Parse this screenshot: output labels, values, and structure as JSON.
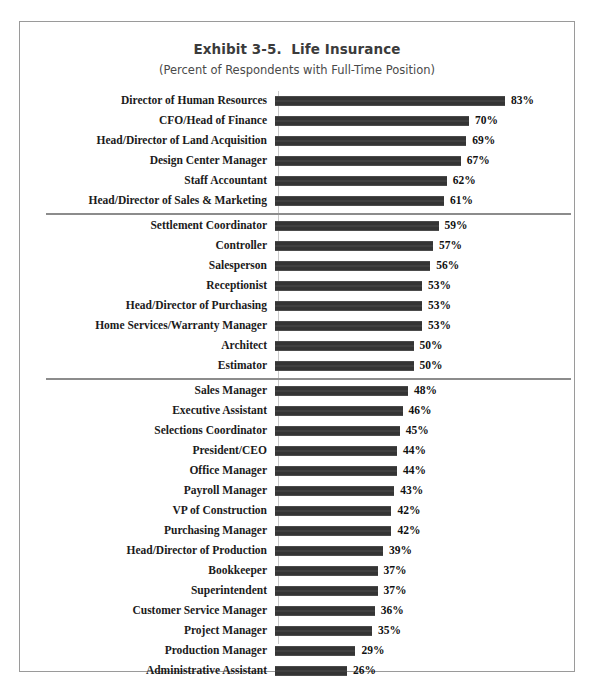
{
  "chart_data": {
    "type": "bar",
    "orientation": "horizontal",
    "title": "Exhibit 3-5.  Life Insurance",
    "subtitle": "(Percent of Respondents with Full-Time Position)",
    "xlabel": "",
    "ylabel": "",
    "xlim": [
      0,
      83
    ],
    "grid": false,
    "legend": null,
    "value_suffix": "%",
    "bar_color": "#3c3c3c",
    "separator_color": "#8c8c8c",
    "border_color": "#9a9a9a",
    "categories": [
      "Director of Human Resources",
      "CFO/Head of Finance",
      "Head/Director of Land Acquisition",
      "Design Center Manager",
      "Staff Accountant",
      "Head/Director of Sales & Marketing",
      "Settlement Coordinator",
      "Controller",
      "Salesperson",
      "Receptionist",
      "Head/Director of Purchasing",
      "Home Services/Warranty Manager",
      "Architect",
      "Estimator",
      "Sales Manager",
      "Executive Assistant",
      "Selections Coordinator",
      "President/CEO",
      "Office Manager",
      "Payroll Manager",
      "VP of Construction",
      "Purchasing Manager",
      "Head/Director of Production",
      "Bookkeeper",
      "Superintendent",
      "Customer Service Manager",
      "Project Manager",
      "Production Manager",
      "Administrative Assistant"
    ],
    "values": [
      83,
      70,
      69,
      67,
      62,
      61,
      59,
      57,
      56,
      53,
      53,
      53,
      50,
      50,
      48,
      46,
      45,
      44,
      44,
      43,
      42,
      42,
      39,
      37,
      37,
      36,
      35,
      29,
      26
    ],
    "value_labels": [
      "83%",
      "70%",
      "69%",
      "67%",
      "62%",
      "61%",
      "59%",
      "57%",
      "56%",
      "53%",
      "53%",
      "53%",
      "50%",
      "50%",
      "48%",
      "46%",
      "45%",
      "44%",
      "44%",
      "43%",
      "42%",
      "42%",
      "39%",
      "37%",
      "37%",
      "36%",
      "35%",
      "29%",
      "26%"
    ],
    "group_separators_after": [
      5,
      13
    ],
    "groups": [
      {
        "name": "top-tier",
        "start": 0,
        "end": 5
      },
      {
        "name": "mid-tier",
        "start": 6,
        "end": 13
      },
      {
        "name": "lower-tier",
        "start": 14,
        "end": 28
      }
    ]
  }
}
